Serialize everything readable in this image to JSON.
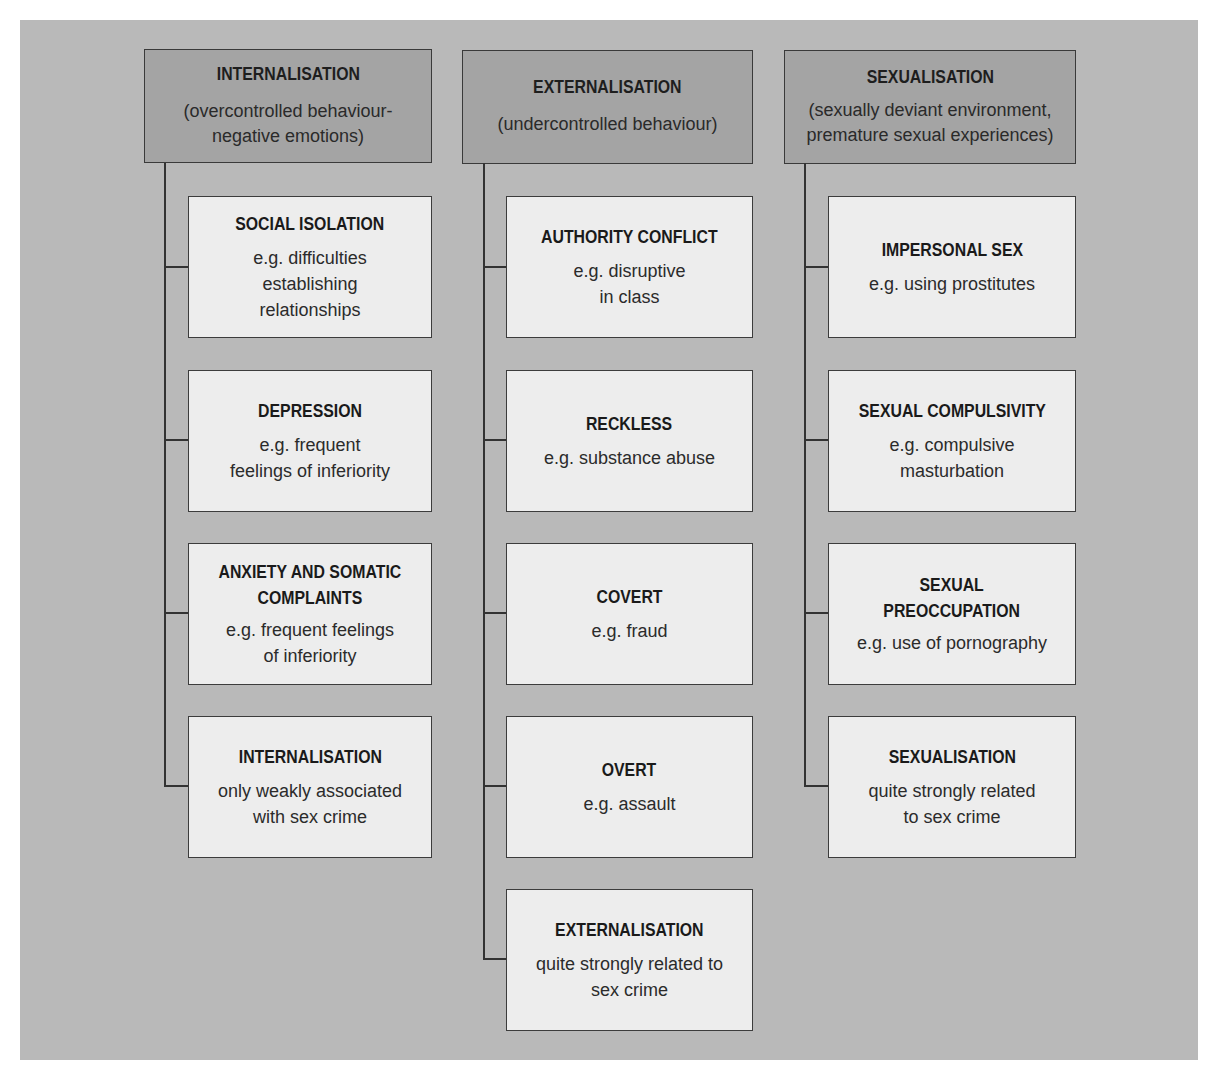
{
  "diagram": {
    "background_color": "#b9b9b9",
    "header_color": "#a4a4a4",
    "box_color": "#ededed",
    "line_color": "#333333",
    "columns": [
      {
        "title": "INTERNALISATION",
        "subtitle": "(overcontrolled behaviour-\nnegative emotions)",
        "items": [
          {
            "title": "SOCIAL ISOLATION",
            "description": "e.g. difficulties\nestablishing\nrelationships"
          },
          {
            "title": "DEPRESSION",
            "description": "e.g. frequent\nfeelings of inferiority"
          },
          {
            "title": "ANXIETY AND SOMATIC\nCOMPLAINTS",
            "description": "e.g. frequent feelings\nof inferiority"
          },
          {
            "title": "INTERNALISATION",
            "description": "only weakly associated\nwith sex crime"
          }
        ]
      },
      {
        "title": "EXTERNALISATION",
        "subtitle": "(undercontrolled behaviour)",
        "items": [
          {
            "title": "AUTHORITY CONFLICT",
            "description": "e.g. disruptive\nin class"
          },
          {
            "title": "RECKLESS",
            "description": "e.g. substance abuse"
          },
          {
            "title": "COVERT",
            "description": "e.g. fraud"
          },
          {
            "title": "OVERT",
            "description": "e.g. assault"
          },
          {
            "title": "EXTERNALISATION",
            "description": "quite strongly related to\nsex crime"
          }
        ]
      },
      {
        "title": "SEXUALISATION",
        "subtitle": "(sexually deviant environment,\npremature sexual experiences)",
        "items": [
          {
            "title": "IMPERSONAL SEX",
            "description": "e.g. using prostitutes"
          },
          {
            "title": "SEXUAL COMPULSIVITY",
            "description": "e.g. compulsive\nmasturbation"
          },
          {
            "title": "SEXUAL\nPREOCCUPATION",
            "description": "e.g. use of pornography"
          },
          {
            "title": "SEXUALISATION",
            "description": "quite strongly related\nto sex crime"
          }
        ]
      }
    ]
  }
}
